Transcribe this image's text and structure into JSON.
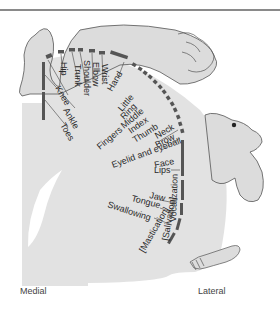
{
  "figure": {
    "axis": {
      "left_label": "Medial",
      "right_label": "Lateral"
    },
    "colors": {
      "cortex_fill": "#e2e2e2",
      "bar": "#555555",
      "body_fill": "#dcdcdc",
      "outline": "#555555",
      "text": "#2a2a2a"
    }
  },
  "labels": {
    "hip": "Hip",
    "trunk": "Trunk",
    "shoulder": "Shoulder",
    "elbow": "Elbow",
    "wrist": "Wrist",
    "hand": "Hand",
    "knee": "Knee",
    "ankle": "Ankle",
    "toes": "Toes",
    "little": "Little",
    "ring": "Ring",
    "middle": "Middle",
    "index": "Index",
    "thumb": "Thumb",
    "fingers": "Fingers",
    "neck": "Neck",
    "brow": "Brow",
    "eyelid_eyeball": "Eyelid and eyeball",
    "face": "Face",
    "lips": "Lips",
    "jaw": "Jaw",
    "tongue": "Tongue",
    "swallowing": "Swallowing",
    "mastication": "[Mastication]",
    "salivation": "[Salivation]",
    "vocalization": "Vocalization"
  }
}
